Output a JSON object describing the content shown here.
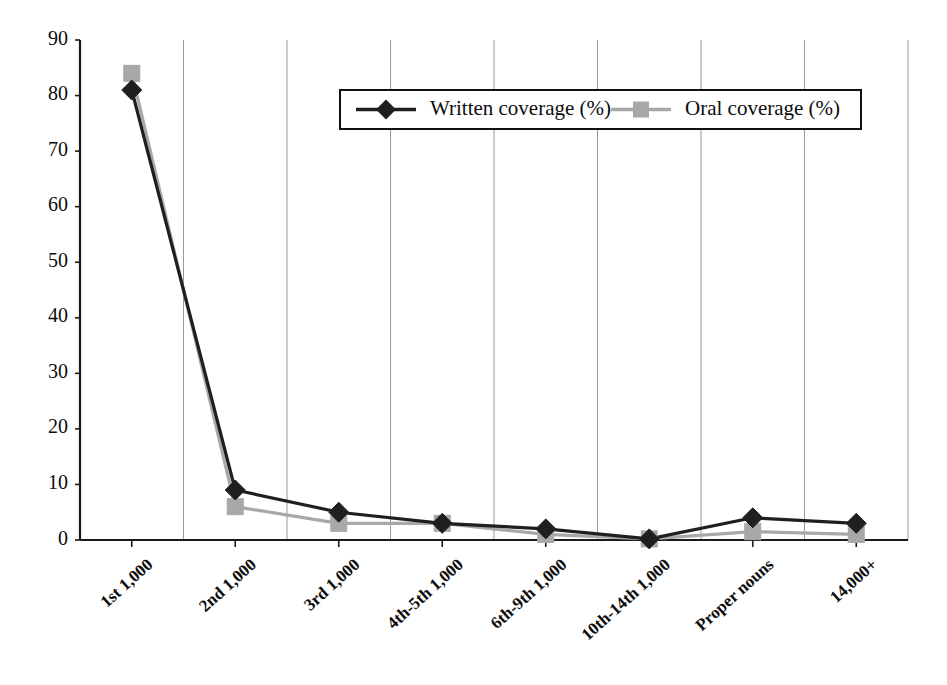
{
  "chart_data": {
    "type": "line",
    "title": "",
    "subtitle": "",
    "xlabel": "",
    "ylabel": "",
    "ylim": [
      0,
      90
    ],
    "ytick_step": 10,
    "yticks": [
      0,
      10,
      20,
      30,
      40,
      50,
      60,
      70,
      80,
      90
    ],
    "grid": "vertical",
    "legend_position": "top-center",
    "categories": [
      "1st 1,000",
      "2nd 1,000",
      "3rd 1,000",
      "4th-5th 1,000",
      "6th-9th 1,000",
      "10th-14th 1,000",
      "Proper nouns",
      "14,000+"
    ],
    "series": [
      {
        "name": "Written coverage (%)",
        "color": "#1f1f1f",
        "marker": "diamond",
        "values": [
          81,
          9,
          5,
          3,
          2,
          0.2,
          4,
          3
        ]
      },
      {
        "name": "Oral coverage (%)",
        "color": "#a8a8a8",
        "marker": "square",
        "values": [
          84,
          6,
          3,
          3,
          1,
          0.2,
          1.5,
          1
        ]
      }
    ]
  },
  "legend": {
    "items": [
      {
        "label": "Written coverage (%)",
        "marker": "diamond-marker",
        "color": "#1f1f1f"
      },
      {
        "label": "Oral coverage (%)",
        "marker": "square-marker",
        "color": "#a8a8a8"
      }
    ]
  },
  "axes": {
    "y_tick_labels": [
      "90",
      "80",
      "70",
      "60",
      "50",
      "40",
      "30",
      "20",
      "10",
      "0"
    ],
    "x_tick_labels": [
      "1st 1,000",
      "2nd 1,000",
      "3rd 1,000",
      "4th-5th 1,000",
      "6th-9th 1,000",
      "10th-14th 1,000",
      "Proper nouns",
      "14,000+"
    ]
  }
}
